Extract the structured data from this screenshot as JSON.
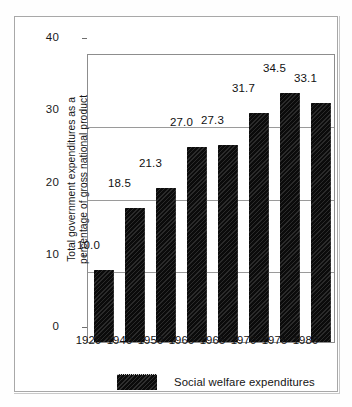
{
  "chart_data": {
    "type": "bar",
    "title": "",
    "xlabel": "",
    "ylabel": "Total government expenditures as a percentage of gross national product",
    "ylabel_line1": "Total government expenditures as a",
    "ylabel_line2": "percentage of gross national product",
    "categories": [
      "1929",
      "1940",
      "1950",
      "1960",
      "1965",
      "1970",
      "1975",
      "1980"
    ],
    "values": [
      10.0,
      18.5,
      21.3,
      27.0,
      27.3,
      31.7,
      34.5,
      33.1
    ],
    "value_labels": [
      "10.0",
      "18.5",
      "21.3",
      "27.0",
      "27.3",
      "31.7",
      "34.5",
      "33.1"
    ],
    "ylim": [
      0,
      40
    ],
    "yticks": [
      0,
      10,
      20,
      30,
      40
    ],
    "ytick_labels": [
      "0",
      "10",
      "20",
      "30",
      "40"
    ],
    "grid": true,
    "legend_position": "bottom",
    "legend": [
      {
        "label": "Social welfare expenditures",
        "color": "#0b0b0b",
        "pattern": "diagonal-hatch"
      }
    ],
    "series": [
      {
        "name": "Social welfare expenditures",
        "values": [
          10.0,
          18.5,
          21.3,
          27.0,
          27.3,
          31.7,
          34.5,
          33.1
        ]
      }
    ],
    "colors": {
      "bar": "#0b0b0b",
      "grid": "#9a9a9a",
      "frame": "#8d8d8d",
      "background": "#ffffff"
    }
  }
}
